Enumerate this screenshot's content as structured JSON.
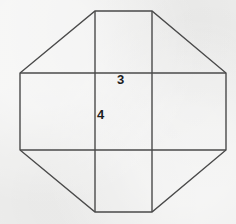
{
  "figure": {
    "canvas": {
      "width": 236,
      "height": 224
    },
    "background_color": "#efefee",
    "stroke_color": "#4a4a4a",
    "stroke_width": 1.4,
    "label_color": "#1d1d1d",
    "shapes": {
      "octagon": {
        "name": "octagon-outline",
        "points": "95,11 152,11 226,73 226,150 152,212 95,212 20,150 20,73",
        "fill": "none"
      },
      "grid_lines": [
        {
          "name": "vertical-line-left",
          "x1": 95,
          "y1": 11,
          "x2": 95,
          "y2": 212
        },
        {
          "name": "vertical-line-right",
          "x1": 152,
          "y1": 11,
          "x2": 152,
          "y2": 212
        },
        {
          "name": "horizontal-line-top",
          "x1": 20,
          "y1": 73,
          "x2": 226,
          "y2": 73
        },
        {
          "name": "horizontal-line-bottom",
          "x1": 20,
          "y1": 150,
          "x2": 226,
          "y2": 150
        }
      ]
    },
    "labels": {
      "side_top": "3",
      "side_left": "4"
    }
  }
}
